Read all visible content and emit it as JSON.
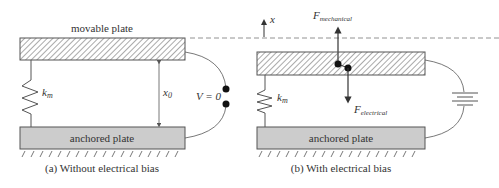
{
  "panel_a": {
    "movable_plate_label": "movable plate",
    "anchored_plate_label": "anchored plate",
    "spring_label_main": "k",
    "spring_label_sub": "m",
    "gap_label_main": "x",
    "gap_label_sub": "0",
    "voltage_label": "V = 0",
    "caption": "(a) Without electrical bias"
  },
  "panel_b": {
    "axis_label": "x",
    "force_mech_main": "F",
    "force_mech_sub": "mechanical",
    "force_elec_main": "F",
    "force_elec_sub": "electrical",
    "spring_label_main": "k",
    "spring_label_sub": "m",
    "anchored_plate_label": "anchored plate",
    "caption": "(b) With electrical bias"
  },
  "colors": {
    "line": "#555555",
    "anchored_fill": "#cccccc",
    "text": "#333333"
  }
}
